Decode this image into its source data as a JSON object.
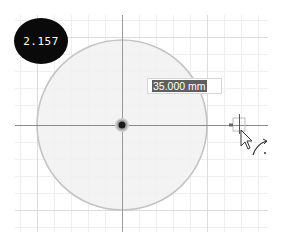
{
  "scale_badge": {
    "value": "2.157"
  },
  "dimension_input": {
    "value": "35.000 mm"
  },
  "sketch": {
    "circle": {
      "center_x": 122,
      "center_y": 125,
      "radius": 85,
      "diameter_label": "35.000 mm"
    },
    "colors": {
      "grid_minor": "#efefef",
      "grid_major": "#dcdcdc",
      "axis": "#9a9a9a",
      "circle_fill": "#f1f1f1",
      "circle_stroke": "#c4c4c4",
      "center_dot": "#1a1a1a",
      "center_ring": "#a8a8a8",
      "badge_bg": "#0a0a0a",
      "selection_bg": "#5f5f5f"
    }
  },
  "cursor": {
    "icon": "arrow-cursor-with-arc-icon"
  }
}
